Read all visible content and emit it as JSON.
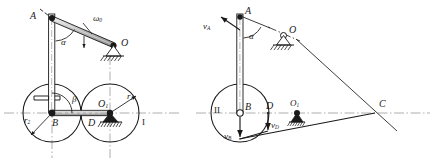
{
  "figure": {
    "stroke_color": "#1a1a1a",
    "axis_color": "#9a9a9a",
    "shade_color": "#b8b8b8"
  },
  "left_panel": {
    "name": "mechanism-configuration-diagram",
    "labels": {
      "point_A": "A",
      "angle_alpha": "α",
      "omega_zero": "ω",
      "omega_zero_sub": "0",
      "point_O": "O",
      "angle_beta": "β",
      "point_B": "B",
      "point_D": "D",
      "point_O1": "O",
      "point_O1_sub": "1",
      "radius_r1": "r",
      "radius_r1_sub": "1",
      "radius_r2": "r",
      "radius_r2_sub": "2",
      "wheel_I": "I"
    }
  },
  "right_panel": {
    "name": "velocity-analysis-diagram",
    "labels": {
      "velocity_A": "v",
      "velocity_A_sub": "A",
      "point_A": "A",
      "angle_alpha": "α",
      "point_O": "O",
      "wheel_II": "II",
      "point_B": "B",
      "point_D": "D",
      "point_O1": "O",
      "point_O1_sub": "1",
      "velocity_B": "v",
      "velocity_B_sub": "B",
      "velocity_D": "v",
      "velocity_D_sub": "D",
      "point_C": "C"
    }
  }
}
